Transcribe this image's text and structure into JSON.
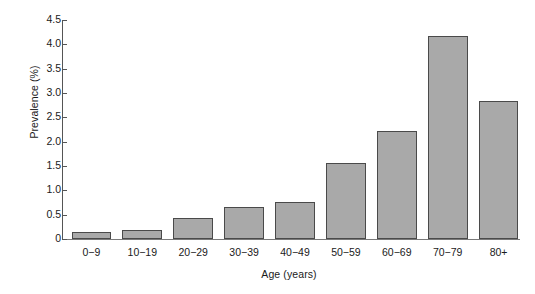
{
  "chart_data": {
    "type": "bar",
    "title": "",
    "subtitle": "",
    "xlabel": "Age (years)",
    "ylabel": "Prevalence (%)",
    "categories": [
      "0−9",
      "10−19",
      "20−29",
      "30−39",
      "40−49",
      "50−59",
      "60−69",
      "70−79",
      "80+"
    ],
    "values": [
      0.15,
      0.19,
      0.44,
      0.66,
      0.77,
      1.57,
      2.22,
      4.18,
      2.84
    ],
    "ylim": [
      0,
      4.5
    ],
    "ytick_labels": [
      "0",
      "0.5",
      "1.0",
      "1.5",
      "2.0",
      "2.5",
      "3.0",
      "3.5",
      "4.0",
      "4.5"
    ],
    "ytick_values": [
      0,
      0.5,
      1.0,
      1.5,
      2.0,
      2.5,
      3.0,
      3.5,
      4.0,
      4.5
    ],
    "grid": false,
    "legend": false,
    "legend_position": "none",
    "bar_fill_color": "#a9a9a9",
    "bar_edge_color": "#4a4a4a",
    "axis_color": "#555555",
    "background_color": "#ffffff"
  }
}
